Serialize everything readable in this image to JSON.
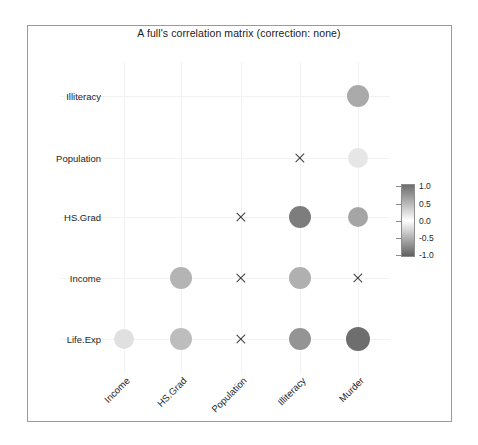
{
  "chart_data": {
    "type": "heatmap",
    "title": "A full's correlation matrix (correction: none)",
    "xlabel": "",
    "ylabel": "",
    "grid": true,
    "legend_position": "right",
    "marker_style": "circle-size-and-shade; X = not significant",
    "x_categories": [
      "Income",
      "HS.Grad",
      "Population",
      "Illiteracy",
      "Murder"
    ],
    "y_categories": [
      "Illiteracy",
      "Population",
      "HS.Grad",
      "Income",
      "Life.Exp"
    ],
    "colorbar": {
      "min": -1.0,
      "max": 1.0,
      "ticks": [
        "1.0",
        "0.5",
        "0.0",
        "-0.5",
        "-1.0"
      ],
      "tick_values": [
        1.0,
        0.5,
        0.0,
        -0.5,
        -1.0
      ],
      "color_high": "#6e6e6e",
      "color_mid": "#ffffff",
      "color_low": "#5f5f5f"
    },
    "cells": [
      {
        "row": "Illiteracy",
        "col": "Income",
        "value": null,
        "marker": "none"
      },
      {
        "row": "Illiteracy",
        "col": "HS.Grad",
        "value": null,
        "marker": "none"
      },
      {
        "row": "Illiteracy",
        "col": "Population",
        "value": null,
        "marker": "none"
      },
      {
        "row": "Illiteracy",
        "col": "Illiteracy",
        "value": null,
        "marker": "none"
      },
      {
        "row": "Illiteracy",
        "col": "Murder",
        "value": 0.7,
        "marker": "circle",
        "color": "#aaaaaa",
        "radius": 11
      },
      {
        "row": "Population",
        "col": "Income",
        "value": null,
        "marker": "none"
      },
      {
        "row": "Population",
        "col": "HS.Grad",
        "value": null,
        "marker": "none"
      },
      {
        "row": "Population",
        "col": "Population",
        "value": null,
        "marker": "none"
      },
      {
        "row": "Population",
        "col": "Illiteracy",
        "value": 0.11,
        "marker": "x",
        "size": 12
      },
      {
        "row": "Population",
        "col": "Murder",
        "value": 0.34,
        "marker": "circle",
        "color": "#e6e6e6",
        "radius": 10
      },
      {
        "row": "HS.Grad",
        "col": "Income",
        "value": null,
        "marker": "none"
      },
      {
        "row": "HS.Grad",
        "col": "HS.Grad",
        "value": null,
        "marker": "none"
      },
      {
        "row": "HS.Grad",
        "col": "Population",
        "value": -0.1,
        "marker": "x",
        "size": 12
      },
      {
        "row": "HS.Grad",
        "col": "Illiteracy",
        "value": -0.66,
        "marker": "circle",
        "color": "#7d7d7d",
        "radius": 11
      },
      {
        "row": "HS.Grad",
        "col": "Murder",
        "value": -0.49,
        "marker": "circle",
        "color": "#a5a5a5",
        "radius": 10
      },
      {
        "row": "Income",
        "col": "Income",
        "value": null,
        "marker": "none"
      },
      {
        "row": "Income",
        "col": "HS.Grad",
        "value": 0.62,
        "marker": "circle",
        "color": "#b4b4b4",
        "radius": 11
      },
      {
        "row": "Income",
        "col": "Population",
        "value": 0.21,
        "marker": "x",
        "size": 12
      },
      {
        "row": "Income",
        "col": "Illiteracy",
        "value": -0.44,
        "marker": "circle",
        "color": "#b0b0b0",
        "radius": 11
      },
      {
        "row": "Income",
        "col": "Murder",
        "value": -0.23,
        "marker": "x",
        "size": 12
      },
      {
        "row": "Life.Exp",
        "col": "Income",
        "value": 0.34,
        "marker": "circle",
        "color": "#e0e0e0",
        "radius": 10
      },
      {
        "row": "Life.Exp",
        "col": "HS.Grad",
        "value": 0.58,
        "marker": "circle",
        "color": "#bdbdbd",
        "radius": 11
      },
      {
        "row": "Life.Exp",
        "col": "Population",
        "value": -0.07,
        "marker": "x",
        "size": 12
      },
      {
        "row": "Life.Exp",
        "col": "Illiteracy",
        "value": -0.59,
        "marker": "circle",
        "color": "#949494",
        "radius": 11
      },
      {
        "row": "Life.Exp",
        "col": "Murder",
        "value": -0.78,
        "marker": "circle",
        "color": "#6e6e6e",
        "radius": 12
      }
    ]
  },
  "layout": {
    "col_x": [
      124,
      181,
      241,
      300,
      358
    ],
    "row_y": [
      96,
      158,
      217,
      278,
      339
    ],
    "ylabel_right": 101,
    "xlabel_top": 375,
    "legend_tick_y": [
      186,
      204,
      221,
      238,
      255
    ]
  }
}
